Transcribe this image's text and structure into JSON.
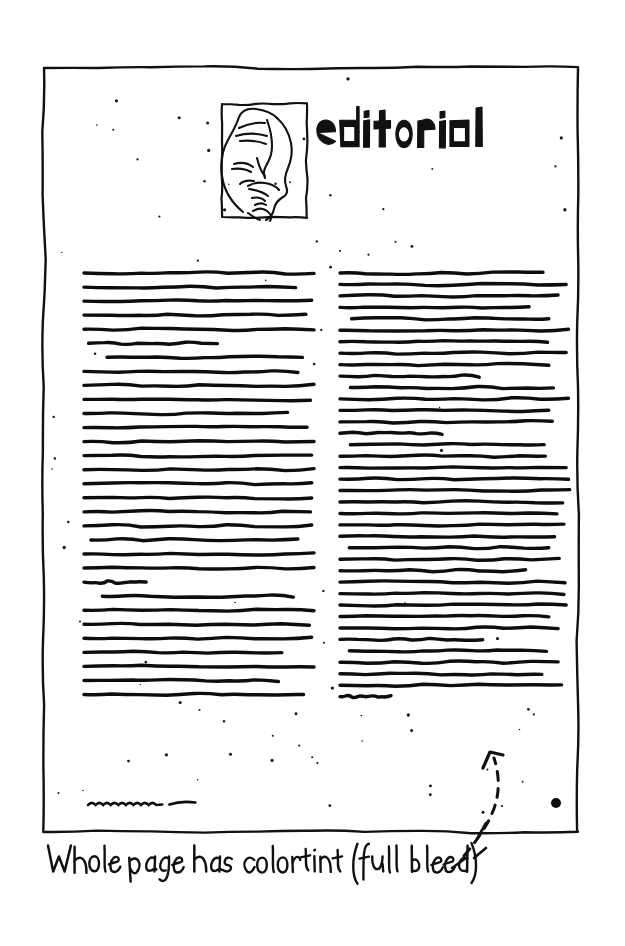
{
  "document": {
    "kind": "hand-drawn page layout sketch",
    "medium": "black ink on white paper",
    "page_title": "editorial",
    "title_style": "hand-lettered chunky display capitals, lowercase forms"
  },
  "page_frame": {
    "name": "page-border",
    "description": "hand-drawn wavy rectangle outlining the trim of the page",
    "left": 44,
    "top": 68,
    "right": 578,
    "bottom": 832,
    "stroke_color": "#111111"
  },
  "header": {
    "title": "editorial",
    "title_x": 316,
    "title_y": 107,
    "title_width": 172,
    "title_height": 40,
    "portrait": {
      "name": "editor-portrait",
      "caption": "line-art portrait of a man with mustache resting chin on hand",
      "x": 222,
      "y": 104,
      "width": 85,
      "height": 113
    }
  },
  "body": {
    "columns": [
      {
        "name": "left-column",
        "label": "left text column",
        "x": 84,
        "width": 230,
        "top": 273,
        "line_gap": 14.05,
        "line_count": 31,
        "line_lengths": [
          1.0,
          0.92,
          0.99,
          0.965,
          1.0,
          0.58,
          0.95,
          0.93,
          1.0,
          0.985,
          0.885,
          0.97,
          1.0,
          0.99,
          1.0,
          0.99,
          0.99,
          0.985,
          0.99,
          0.93,
          1.0,
          1.0,
          0.27,
          0.91,
          1.0,
          0.98,
          0.99,
          0.86,
          1.0,
          0.845,
          0.955
        ],
        "line_indents": [
          0,
          0,
          0,
          0,
          0,
          0.02,
          0.1,
          0,
          0,
          0,
          0,
          0,
          0,
          0,
          0,
          0,
          0,
          0,
          0,
          0.03,
          0,
          0,
          0,
          0.08,
          0,
          0,
          0,
          0,
          0,
          0,
          0
        ]
      },
      {
        "name": "right-column",
        "label": "right text column",
        "x": 340,
        "width": 232,
        "top": 273,
        "line_gap": 11.45,
        "line_count": 38,
        "line_lengths": [
          0.875,
          0.975,
          0.94,
          0.815,
          0.9,
          0.985,
          0.895,
          0.975,
          0.9,
          0.6,
          0.92,
          0.985,
          0.9,
          0.915,
          0.44,
          0.88,
          0.885,
          0.975,
          0.985,
          0.99,
          0.96,
          0.935,
          0.965,
          0.925,
          0.9,
          0.945,
          0.8,
          0.97,
          0.965,
          0.975,
          0.9,
          0.94,
          0.615,
          0.89,
          0.94,
          0.87,
          0.955,
          0.22
        ],
        "line_indents": [
          0,
          0,
          0,
          0,
          0.05,
          0,
          0,
          0,
          0,
          0,
          0.045,
          0,
          0,
          0,
          0,
          0.045,
          0,
          0,
          0,
          0,
          0,
          0,
          0,
          0,
          0.04,
          0,
          0,
          0,
          0,
          0,
          0,
          0,
          0,
          0.04,
          0,
          0,
          0,
          0
        ]
      }
    ],
    "byline_mark": {
      "name": "byline-squiggle",
      "description": "small zigzag squiggle standing in for a signature or byline",
      "x": 88,
      "y": 805,
      "width": 110
    }
  },
  "annotation": {
    "caption": "Whole page has colortint (full bleed)",
    "caption_x": 48,
    "caption_baseline": 872,
    "handwriting": true,
    "arrow": {
      "name": "colortint-callout-arrow",
      "style": "dashed curved arrow pointing up-left into the page area",
      "head_x": 490,
      "head_y": 752,
      "tail_x": 464,
      "tail_y": 856
    },
    "leader_tick": {
      "name": "border-tick-mark",
      "x": 480,
      "y": 832
    },
    "registration_dot": {
      "name": "registration-dot",
      "x": 556,
      "y": 803,
      "radius": 5
    }
  },
  "texture": {
    "name": "paper-speckle",
    "description": "scattered fine ink specks across the page interior suggesting a tint screen",
    "dot_count": 150,
    "dot_color": "#1a1a1a",
    "min_radius": 0.7,
    "max_radius": 1.7
  },
  "colors": {
    "ink": "#111111",
    "paper": "#ffffff",
    "speckle": "#1a1a1a"
  }
}
